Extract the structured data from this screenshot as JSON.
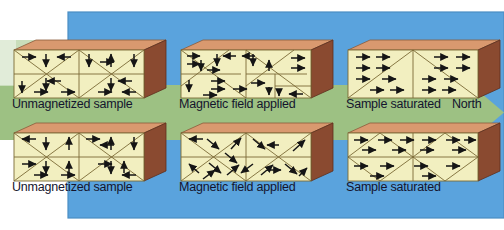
{
  "figure": {
    "background": {
      "page_color": "#ffffff",
      "panel_color": "#5aa3dd",
      "band_color": "#9dc183"
    }
  },
  "direction_arrow": {
    "label": "North",
    "color": "#9dc183",
    "points": "right"
  },
  "rows": [
    {
      "name": "domain-wall-motion-row",
      "blocks": [
        {
          "caption": "Unmagnetized sample",
          "state": "unmagnetized",
          "arrow_directions": [
            "right",
            "down",
            "left",
            "down",
            "up",
            "down",
            "left",
            "right",
            "down",
            "down",
            "left",
            "down",
            "right",
            "right",
            "down",
            "left"
          ]
        },
        {
          "caption": "Magnetic field applied",
          "state": "field-applied",
          "arrow_directions": [
            "right",
            "right",
            "left",
            "down",
            "left",
            "up",
            "right",
            "right",
            "down",
            "left",
            "up",
            "right",
            "right",
            "right",
            "down",
            "left"
          ]
        },
        {
          "caption": "Sample saturated",
          "state": "saturated",
          "arrow_directions": [
            "right",
            "right",
            "right",
            "right",
            "right",
            "right",
            "right",
            "right",
            "right",
            "right",
            "right",
            "right",
            "right",
            "right",
            "right",
            "right"
          ]
        }
      ]
    },
    {
      "name": "domain-rotation-row",
      "blocks": [
        {
          "caption": "Unmagnetized sample",
          "state": "unmagnetized",
          "arrow_directions": [
            "left",
            "down",
            "up",
            "right",
            "up",
            "left",
            "up",
            "down",
            "right",
            "down",
            "left",
            "down",
            "up",
            "right",
            "up",
            "left"
          ]
        },
        {
          "caption": "Magnetic field applied",
          "state": "field-applied",
          "arrow_directions": [
            "left",
            "down-right",
            "up-right",
            "down-right",
            "up-right",
            "left",
            "down-right",
            "up-right",
            "down-left",
            "up-right",
            "down-right",
            "up-right",
            "right",
            "down-right",
            "up-right",
            "down-right"
          ]
        },
        {
          "caption": "Sample saturated",
          "state": "saturated",
          "arrow_directions": [
            "right",
            "right",
            "right",
            "right",
            "right",
            "right",
            "right",
            "right",
            "right",
            "right",
            "right",
            "right",
            "right",
            "right",
            "right",
            "right"
          ]
        }
      ]
    }
  ],
  "block_colors": {
    "front_face": "#f2efc0",
    "top_face": "#d4906a",
    "top_face_light": "#e8b193",
    "side_face": "#8a4a30",
    "outline": "#7a6a35",
    "arrow": "#151515"
  }
}
